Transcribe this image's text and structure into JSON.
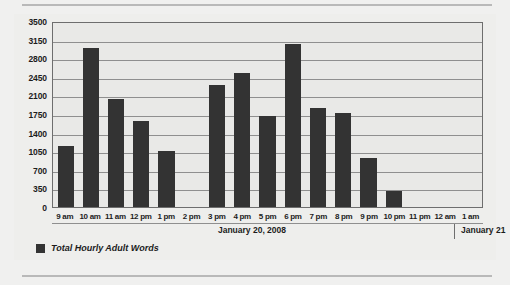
{
  "chart_data": {
    "type": "bar",
    "title": "",
    "xlabel": "",
    "ylabel": "",
    "ylim": [
      0,
      3500
    ],
    "yticks": [
      0,
      350,
      700,
      1050,
      1400,
      1750,
      2100,
      2450,
      2800,
      3150,
      3500
    ],
    "ytick_labels": [
      "0",
      "350",
      "700",
      "1050",
      "1400",
      "1750",
      "2100",
      "2450",
      "2800",
      "3150",
      "3500"
    ],
    "grid": true,
    "legend_position": "bottom-left",
    "series_name": "Total Hourly Adult Words",
    "bar_color": "#333333",
    "categories": [
      "9 am",
      "10 am",
      "11 am",
      "12 pm",
      "1 pm",
      "2 pm",
      "3 pm",
      "4 pm",
      "5 pm",
      "6 pm",
      "7 pm",
      "8 pm",
      "9 pm",
      "10 pm",
      "11 pm",
      "12 am",
      "1 am"
    ],
    "values": [
      1150,
      3000,
      2040,
      1620,
      1050,
      0,
      2300,
      2520,
      1720,
      3060,
      1870,
      1770,
      930,
      310,
      0,
      0,
      0
    ],
    "series": [
      {
        "name": "Total Hourly Adult Words",
        "values": [
          1150,
          3000,
          2040,
          1620,
          1050,
          0,
          2300,
          2520,
          1720,
          3060,
          1870,
          1770,
          930,
          310,
          0,
          0,
          0
        ]
      }
    ],
    "annotations": {
      "date_primary": "January 20, 2008",
      "date_secondary": "January 21",
      "date_divider_after_category": "11 pm"
    }
  },
  "legend": {
    "label": "Total Hourly Adult Words",
    "swatch_color": "#333333"
  },
  "axis": {
    "date_primary": "January 20, 2008",
    "date_secondary": "January 21"
  }
}
